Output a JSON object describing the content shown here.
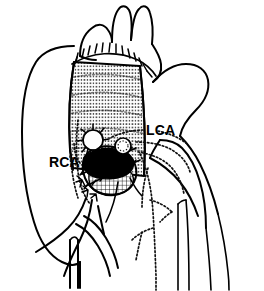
{
  "figure": {
    "kind": "surgical-anatomical-line-drawing",
    "background_color": "#ffffff",
    "ink_color": "#000000",
    "width_px": 264,
    "height_px": 291
  },
  "labels": [
    {
      "id": "rca",
      "text": "RCA",
      "meaning": "right coronary artery",
      "x": 49,
      "y": 167,
      "leader": "dotted-line-to-right-coronary-button"
    },
    {
      "id": "lca",
      "text": "LCA",
      "meaning": "left coronary artery",
      "x": 146,
      "y": 135,
      "leader": "dotted-line-to-left-coronary-course"
    }
  ],
  "structures": [
    {
      "id": "aortic-arch-branches",
      "name": "arch branch vessels",
      "style": "solid-outline"
    },
    {
      "id": "tube-graft",
      "name": "corrugated dacron tube graft",
      "style": "ribbed-texture"
    },
    {
      "id": "proximal-suture-line",
      "name": "distal anastomosis suture line",
      "style": "stitched"
    },
    {
      "id": "right-atrium",
      "name": "right atrial silhouette",
      "style": "solid-outline"
    },
    {
      "id": "pulmonary-artery",
      "name": "pulmonary artery silhouette",
      "style": "solid-outline"
    },
    {
      "id": "coronary-button-dark",
      "name": "reimplanted coronary button",
      "style": "solid-black-fill"
    },
    {
      "id": "coronary-ostium-open",
      "name": "open coronary ostium on graft",
      "style": "open-circle"
    },
    {
      "id": "hidden-coronary-branches",
      "name": "coronary branches behind pulmonary artery",
      "style": "dotted"
    }
  ],
  "legend_note": "Dotted lines denote vessels coursing behind overlying structures."
}
